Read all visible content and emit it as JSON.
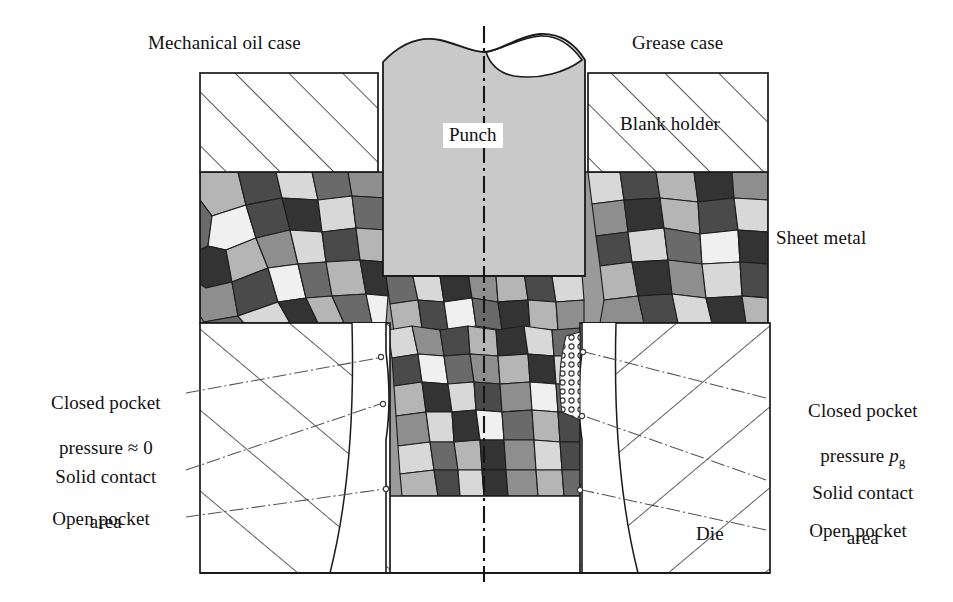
{
  "figure": {
    "type": "technical-cross-section-diagram",
    "symmetry_axis": "vertical dash-dot centerline at x=484"
  },
  "labels": {
    "top_left": "Mechanical oil case",
    "top_right": "Grease case",
    "punch": "Punch",
    "blank_holder": "Blank holder",
    "sheet_metal": "Sheet metal",
    "die": "Die",
    "left_closed_pocket_line1": "Closed pocket",
    "left_closed_pocket_line2": "pressure ≈ 0",
    "left_solid_contact_line1": "Solid contact",
    "left_solid_contact_line2": "area",
    "left_open_pocket": "Open pocket",
    "right_closed_pocket_line1": "Closed pocket",
    "right_closed_pocket_line2_pre": "pressure ",
    "right_closed_pocket_p": "p",
    "right_closed_pocket_sub": "g",
    "right_solid_contact_line1": "Solid contact",
    "right_solid_contact_line2": "area",
    "right_open_pocket": "Open pocket"
  },
  "colors": {
    "background": "#ffffff",
    "outline": "#1a1a1a",
    "punch_fill": "#c9c9c9",
    "tool_fill": "#ffffff",
    "hatch_stroke": "#2b2b2b",
    "leader_stroke": "#555555",
    "grain_light": "#d8d8d8",
    "grain_mid_light": "#b5b5b5",
    "grain_mid": "#8e8e8e",
    "grain_mid_dark": "#6a6a6a",
    "grain_dark": "#4a4a4a",
    "grain_darkest": "#333333",
    "grain_white": "#f0f0f0",
    "centerline": "#151515"
  },
  "geometry": {
    "canvas": {
      "width": 953,
      "height": 602
    },
    "centerline_x": 484,
    "punch": {
      "x": 383,
      "y": 38,
      "w": 202,
      "h": 238
    },
    "blank_holder_left": {
      "x": 200,
      "y": 73,
      "w": 178,
      "h": 99
    },
    "blank_holder_right": {
      "x": 588,
      "y": 73,
      "w": 180,
      "h": 99
    },
    "die_left": {
      "x": 200,
      "y": 323,
      "w": 190,
      "h": 250
    },
    "die_right": {
      "x": 580,
      "y": 323,
      "w": 190,
      "h": 250
    },
    "sheet_band": {
      "x": 200,
      "y": 172,
      "w": 568,
      "h": 151
    },
    "cup_wall": {
      "x_left": 386,
      "x_right": 582,
      "y_top": 323,
      "y_bottom": 496
    }
  }
}
